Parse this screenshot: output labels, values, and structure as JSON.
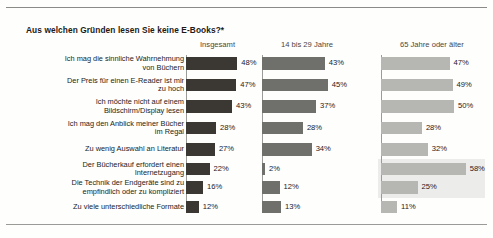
{
  "header": {
    "title": "Aus welchen Gründen lesen Sie keine E-Books?*"
  },
  "chart_data": {
    "type": "bar",
    "orientation": "horizontal",
    "title": "Aus welchen Gründen lesen Sie keine E-Books?*",
    "xlabel": "",
    "ylabel": "",
    "xlim": [
      0,
      60
    ],
    "grid": false,
    "legend_position": "top (column headers)",
    "value_suffix": "%",
    "categories": [
      "Ich mag die sinnliche Wahrnehmung von Büchern",
      "Der Preis für einen E-Reader ist mir zu hoch",
      "Ich möchte nicht auf einem Bildschirm/Display lesen",
      "Ich mag den Anblick meiner Bücher im Regal",
      "Zu wenig Auswahl an Literatur",
      "Der Bücherkauf erfordert einen Internetzugang",
      "Die Technik der Endgeräte sind zu empfindlich oder zu kompliziert",
      "Zu viele unterschiedliche Formate"
    ],
    "category_lines": [
      [
        "Ich mag die sinnliche Wahrnehmung",
        "von Büchern"
      ],
      [
        "Der Preis für einen E-Reader ist mir",
        "zu hoch"
      ],
      [
        "Ich möchte nicht auf einem",
        "Bildschirm/Display lesen"
      ],
      [
        "Ich mag den Anblick meiner Bücher",
        "im Regal"
      ],
      [
        "Zu wenig Auswahl an Literatur"
      ],
      [
        "Der Bücherkauf erfordert einen",
        "Internetzugang"
      ],
      [
        "Die Technik der Endgeräte sind zu",
        "empfindlich oder zu kompliziert"
      ],
      [
        "Zu viele unterschiedliche Formate"
      ]
    ],
    "series": [
      {
        "name": "Insgesamt",
        "color": "#3b3834",
        "values": [
          48,
          47,
          43,
          28,
          27,
          22,
          16,
          12
        ],
        "labels": [
          "48%",
          "47%",
          "43%",
          "28%",
          "27%",
          "22%",
          "16%",
          "12%"
        ]
      },
      {
        "name": "14 bis 29 Jahre",
        "color": "#6f6f6b",
        "values": [
          43,
          45,
          37,
          28,
          34,
          2,
          12,
          13
        ],
        "labels": [
          "43%",
          "45%",
          "37%",
          "28%",
          "34%",
          "2%",
          "12%",
          "13%"
        ]
      },
      {
        "name": "65 Jahre oder älter",
        "color": "#b6b6b2",
        "values": [
          47,
          49,
          50,
          28,
          32,
          58,
          25,
          11
        ],
        "labels": [
          "47%",
          "49%",
          "50%",
          "28%",
          "32%",
          "58%",
          "25%",
          "11%"
        ]
      }
    ],
    "highlight": {
      "series": "65 Jahre oder älter",
      "rows": [
        5,
        6
      ],
      "color": "#ececeb"
    }
  }
}
